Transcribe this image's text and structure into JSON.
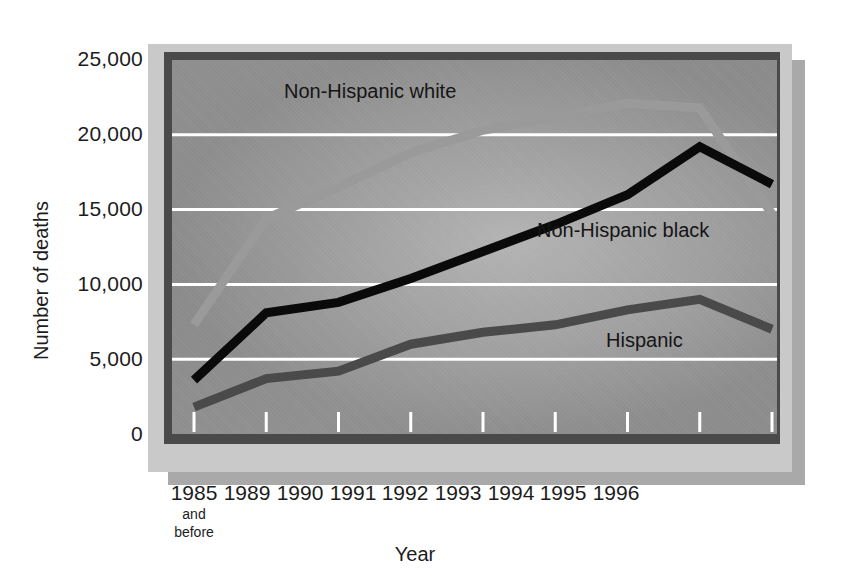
{
  "chart_data": {
    "type": "line",
    "title": "",
    "xlabel": "Year",
    "ylabel": "Number of deaths",
    "categories": [
      "1985",
      "1989",
      "1990",
      "1991",
      "1992",
      "1993",
      "1994",
      "1995",
      "1996"
    ],
    "category_sublabels": [
      "and before",
      "",
      "",
      "",
      "",
      "",
      "",
      "",
      ""
    ],
    "ylim": [
      0,
      25000
    ],
    "ytick_labels": [
      "0",
      "5,000",
      "10,000",
      "15,000",
      "20,000",
      "25,000"
    ],
    "ytick_values": [
      0,
      5000,
      10000,
      15000,
      20000,
      25000
    ],
    "grid": "horizontal-white",
    "legend_position": "inline-labels",
    "series": [
      {
        "name": "Non-Hispanic white",
        "color": "#9a9a9a",
        "values": [
          7300,
          14400,
          16500,
          18800,
          20300,
          21200,
          22100,
          21800,
          14700
        ]
      },
      {
        "name": "Non-Hispanic black",
        "color": "#0a0a0a",
        "values": [
          3600,
          8100,
          8800,
          10400,
          12200,
          14000,
          16000,
          19200,
          16700
        ]
      },
      {
        "name": "Hispanic",
        "color": "#4a4a4a",
        "values": [
          1800,
          3700,
          4200,
          6000,
          6800,
          7300,
          8300,
          9000,
          7000
        ]
      }
    ]
  },
  "labels": {
    "y_25000": "25,000",
    "y_20000": "20,000",
    "y_15000": "15,000",
    "y_10000": "10,000",
    "y_5000": "5,000",
    "y_0": "0",
    "x_1985": "1985",
    "x_1985_sub_line1": "and",
    "x_1985_sub_line2": "before",
    "x_1989": "1989",
    "x_1990": "1990",
    "x_1991": "1991",
    "x_1992": "1992",
    "x_1993": "1993",
    "x_1994": "1994",
    "x_1995": "1995",
    "x_1996": "1996",
    "axis_x_title": "Year",
    "axis_y_title": "Number of deaths",
    "series_white": "Non-Hispanic white",
    "series_black": "Non-Hispanic black",
    "series_hispanic": "Hispanic"
  },
  "colors": {
    "panel_frame": "#c9c9c9",
    "panel_shadow": "#a9a9a9",
    "plot_bevel": "#4a4a4a",
    "plot_surface": "#8c8c8c",
    "gridline": "#ffffff",
    "text": "#1c1c1c"
  }
}
